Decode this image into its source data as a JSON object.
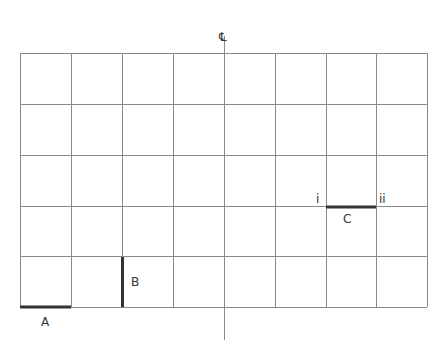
{
  "diagram": {
    "symbol_top": "℄",
    "grid": {
      "columns": 8,
      "rows": 5,
      "left": 20,
      "top": 53,
      "right": 427,
      "bottom": 307
    },
    "centerline": {
      "x": 224,
      "y1": 36,
      "y2": 340
    },
    "segments": [
      {
        "id": "A",
        "label": "A",
        "orientation": "horizontal"
      },
      {
        "id": "B",
        "label": "B",
        "orientation": "vertical"
      },
      {
        "id": "C",
        "label": "C",
        "orientation": "horizontal",
        "end_labels": [
          "i",
          "ii"
        ]
      }
    ],
    "colors": {
      "grid": "#8a8a8a",
      "segment": "#333333"
    }
  }
}
